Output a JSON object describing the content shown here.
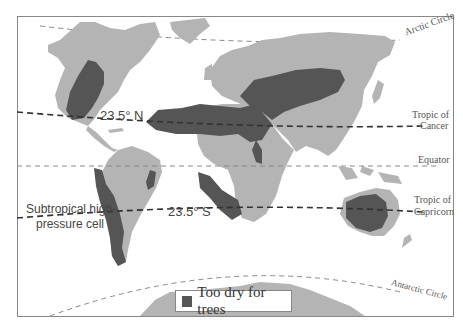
{
  "map": {
    "title": "Global regions too dry for trees",
    "colors": {
      "land": "#b4b4b4",
      "dry": "#555555",
      "ocean": "#ffffff",
      "frame": "#888888",
      "line": "#555555"
    },
    "lines": {
      "arctic_circle": "Arctic Circle",
      "tropic_of_cancer_1": "Tropic of",
      "tropic_of_cancer_2": "Cancer",
      "equator": "Equator",
      "tropic_of_capricorn_1": "Tropic of",
      "tropic_of_capricorn_2": "Capricorn",
      "antarctic_circle": "Antarctic Circle"
    },
    "annotations": {
      "north_latitude": "23.5° N",
      "south_latitude": "23.5° S",
      "pressure_cell_1": "Subtropical high-",
      "pressure_cell_2": "pressure cell"
    },
    "legend": {
      "label": "Too dry for trees"
    }
  }
}
